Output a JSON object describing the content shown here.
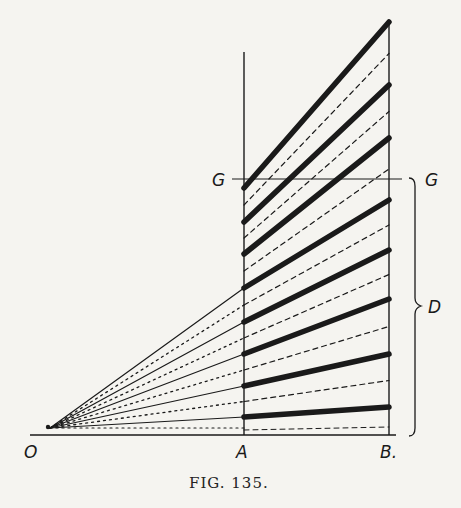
{
  "figure": {
    "caption": "Fig. 135.",
    "caption_display": "FIG. 135.",
    "labels": {
      "origin": "O",
      "point_a": "A",
      "point_b": "B.",
      "g_left": "G",
      "g_right": "G",
      "bracket": "D"
    },
    "colors": {
      "paper": "#f5f4f0",
      "ink": "#1a1a1a"
    },
    "bold_band_count": 8,
    "dashed_line_count": 7,
    "fan_solid_rays": 5,
    "fan_dotted_rays": 4
  }
}
